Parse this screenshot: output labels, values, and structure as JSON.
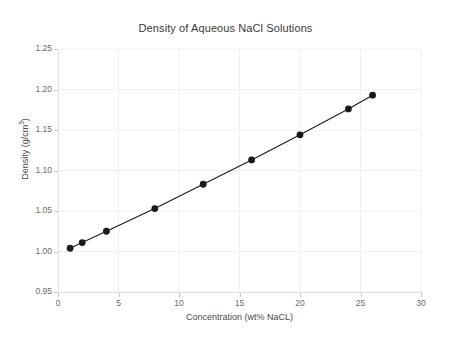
{
  "chart_data": {
    "type": "line",
    "title": "Density of Aqueous NaCl Solutions",
    "xlabel": "Concentration (wt% NaCL)",
    "ylabel_plain": "Density (g/cm3)",
    "ylabel_main": "Density (g/cm",
    "ylabel_sup": "3",
    "ylabel_tail": ")",
    "x": [
      1,
      2,
      4,
      8,
      12,
      16,
      20,
      24,
      26
    ],
    "values": [
      1.004,
      1.011,
      1.025,
      1.053,
      1.083,
      1.113,
      1.144,
      1.176,
      1.193
    ],
    "series": [
      {
        "name": "Density",
        "x": [
          1,
          2,
          4,
          8,
          12,
          16,
          20,
          24,
          26
        ],
        "values": [
          1.004,
          1.011,
          1.025,
          1.053,
          1.083,
          1.113,
          1.144,
          1.176,
          1.193
        ]
      }
    ],
    "xlim": [
      0,
      30
    ],
    "ylim": [
      0.95,
      1.25
    ],
    "xticks": [
      0,
      5,
      10,
      15,
      20,
      25,
      30
    ],
    "xtick_labels": [
      "0",
      "5",
      "10",
      "15",
      "20",
      "25",
      "30"
    ],
    "yticks": [
      0.95,
      1.0,
      1.05,
      1.1,
      1.15,
      1.2,
      1.25
    ],
    "ytick_labels": [
      "0.95",
      "1.00",
      "1.05",
      "1.10",
      "1.15",
      "1.20",
      "1.25"
    ],
    "grid": true,
    "grid_color": "#efefef",
    "legend": false,
    "legend_position": "none",
    "marker": "circle",
    "marker_color": "#1a1a1a",
    "line_color": "#1a1a1a",
    "axis_color": "#d4d4d4",
    "text_color": "#4a4a4a",
    "background": "#ffffff"
  }
}
